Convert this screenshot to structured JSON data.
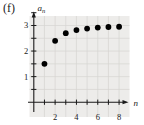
{
  "figure_label": "(f)",
  "chart_data": {
    "type": "scatter",
    "title": "",
    "xlabel": "n",
    "ylabel_base": "a",
    "ylabel_sub": "n",
    "x": [
      1,
      2,
      3,
      4,
      5,
      6,
      7,
      8
    ],
    "values": [
      1.5,
      2.4,
      2.7,
      2.82,
      2.88,
      2.92,
      2.94,
      2.95
    ],
    "xlim": [
      0,
      9
    ],
    "ylim": [
      0,
      3.6
    ],
    "x_ticks": [
      1,
      2,
      3,
      4,
      5,
      6,
      7,
      8
    ],
    "x_tick_labels": [
      "2",
      "4",
      "6",
      "8"
    ],
    "x_tick_label_positions": [
      2,
      4,
      6,
      8
    ],
    "y_ticks": [
      0.5,
      1,
      1.5,
      2,
      2.5,
      3,
      3.5
    ],
    "y_tick_labels": [
      "1",
      "2",
      "3"
    ],
    "y_tick_label_positions": [
      1,
      2,
      3
    ],
    "grid": true,
    "legend_position": "none",
    "colors": {
      "point": "#000000",
      "axis": "#1a1a1a",
      "grid": "#d6d4d1",
      "panel_bg": "#edecea",
      "page_bg": "#ffffff",
      "text": "#1a1a1a"
    }
  }
}
